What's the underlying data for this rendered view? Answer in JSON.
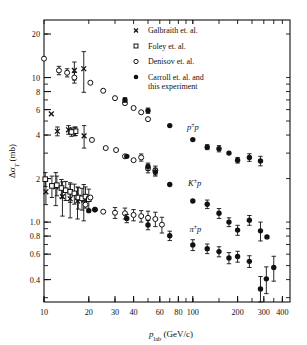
{
  "figure": {
    "title": "",
    "ylabel": "Δσ",
    "ylabel_sub": "T",
    "ylabel_unit": " (mb)",
    "xlabel": "p",
    "xlabel_sub": "lab",
    "xlabel_unit": " (GeV/c)"
  },
  "legend": {
    "items": [
      {
        "label": "Galbraith et. al.",
        "marker": "cross"
      },
      {
        "label": "Foley et. al.",
        "marker": "open-square"
      },
      {
        "label": "Denisov et. al.",
        "marker": "open-circle"
      },
      {
        "label": "Carroll et. al. and",
        "label2": "this experiment",
        "marker": "filled-circle"
      }
    ]
  },
  "annotations": [
    {
      "text": "p",
      "sup": "±",
      "text2": "p",
      "x": 100,
      "y": 4.35
    },
    {
      "text": "K",
      "sup": "±",
      "text2": "p",
      "x": 103,
      "y": 1.78
    },
    {
      "text": "π",
      "sup": "±",
      "text2": "p",
      "x": 104,
      "y": 0.86
    }
  ],
  "chart_data": {
    "type": "scatter",
    "scale": {
      "x": "log",
      "y": "log"
    },
    "xlim": [
      10,
      450
    ],
    "ylim": [
      0.28,
      25
    ],
    "xlabel": "p_lab (GeV/c)",
    "ylabel": "Δσ_T (mb)",
    "xticks": [
      10,
      20,
      30,
      40,
      60,
      80,
      100,
      200,
      300,
      400
    ],
    "xticklabels": [
      "10",
      "20",
      "30",
      "40",
      "60",
      "80",
      "100",
      "200",
      "300",
      "400"
    ],
    "yticks": [
      20,
      10,
      8,
      6,
      4,
      2,
      1.0,
      0.8,
      0.6,
      0.4
    ],
    "yticklabels": [
      "20",
      "10",
      "8",
      "6",
      "4",
      "2",
      "1.0",
      "0.8",
      "0.6",
      "0.4"
    ],
    "grid": false,
    "legend_position": "upper-right",
    "series": [
      {
        "name": "Galbraith et. al.",
        "marker": "cross",
        "points": [
          {
            "x": 16.0,
            "y": 11.2,
            "ey": 1.6
          },
          {
            "x": 18.5,
            "y": 11.5,
            "ey": 3.6
          },
          {
            "x": 12.3,
            "y": 4.25,
            "ey": 0.3
          },
          {
            "x": 14.6,
            "y": 4.35,
            "ey": 0.3
          },
          {
            "x": 16.1,
            "y": 4.25,
            "ey": 0.3
          },
          {
            "x": 18.6,
            "y": 3.95,
            "ey": 0.7
          },
          {
            "x": 10.3,
            "y": 1.62,
            "ey": 0.3
          },
          {
            "x": 12.0,
            "y": 1.75,
            "ey": 0.45
          },
          {
            "x": 13.3,
            "y": 1.5,
            "ey": 0.4
          },
          {
            "x": 15.0,
            "y": 1.45,
            "ey": 0.38
          },
          {
            "x": 16.8,
            "y": 1.4,
            "ey": 0.35
          },
          {
            "x": 18.5,
            "y": 1.42,
            "ey": 0.4
          },
          {
            "x": 11.2,
            "y": 5.6,
            "ey": 0.0
          }
        ]
      },
      {
        "name": "Foley et. al.",
        "marker": "open-square",
        "points": [
          {
            "x": 10.2,
            "y": 1.98,
            "ey": 0.22
          },
          {
            "x": 11.3,
            "y": 1.78,
            "ey": 0.3
          },
          {
            "x": 12.2,
            "y": 1.8,
            "ey": 0.28
          },
          {
            "x": 13.1,
            "y": 1.72,
            "ey": 0.25
          },
          {
            "x": 14.0,
            "y": 1.66,
            "ey": 0.25
          },
          {
            "x": 15.0,
            "y": 1.62,
            "ey": 0.25
          },
          {
            "x": 16.0,
            "y": 1.58,
            "ey": 0.25
          },
          {
            "x": 17.0,
            "y": 1.48,
            "ey": 0.25
          },
          {
            "x": 18.0,
            "y": 1.46,
            "ey": 0.25
          },
          {
            "x": 19.0,
            "y": 1.5,
            "ey": 0.25
          },
          {
            "x": 20.0,
            "y": 1.44,
            "ey": 0.25
          },
          {
            "x": 16.3,
            "y": 4.25,
            "ey": 0.28
          },
          {
            "x": 15.3,
            "y": 4.2,
            "ey": 0.28
          }
        ]
      },
      {
        "name": "Denisov et. al.",
        "marker": "open-circle",
        "points": [
          {
            "x": 10.0,
            "y": 13.5,
            "ey": 0.0
          },
          {
            "x": 12.6,
            "y": 11.2,
            "ey": 0.75
          },
          {
            "x": 14.3,
            "y": 10.8,
            "ey": 0.7
          },
          {
            "x": 16.0,
            "y": 10.0,
            "ey": 0.85
          },
          {
            "x": 20.5,
            "y": 9.2,
            "ey": 0.0
          },
          {
            "x": 25.0,
            "y": 8.1,
            "ey": 0.0
          },
          {
            "x": 30.0,
            "y": 7.2,
            "ey": 0.0
          },
          {
            "x": 35.0,
            "y": 6.65,
            "ey": 0.0
          },
          {
            "x": 40.0,
            "y": 6.15,
            "ey": 0.0
          },
          {
            "x": 45.0,
            "y": 5.75,
            "ey": 0.0
          },
          {
            "x": 50.0,
            "y": 5.15,
            "ey": 0.0
          },
          {
            "x": 21.0,
            "y": 3.7,
            "ey": 0.0
          },
          {
            "x": 26.0,
            "y": 3.25,
            "ey": 0.0
          },
          {
            "x": 30.5,
            "y": 3.15,
            "ey": 0.0
          },
          {
            "x": 35.0,
            "y": 2.85,
            "ey": 0.0
          },
          {
            "x": 40.0,
            "y": 2.68,
            "ey": 0.0
          },
          {
            "x": 45.0,
            "y": 2.8,
            "ey": 0.16
          },
          {
            "x": 50.0,
            "y": 2.35,
            "ey": 0.16
          },
          {
            "x": 56.0,
            "y": 2.28,
            "ey": 0.16
          },
          {
            "x": 22.0,
            "y": 1.22,
            "ey": 0.0
          },
          {
            "x": 25.0,
            "y": 1.18,
            "ey": 0.0
          },
          {
            "x": 30.0,
            "y": 1.16,
            "ey": 0.1
          },
          {
            "x": 35.0,
            "y": 1.15,
            "ey": 0.1
          },
          {
            "x": 40.0,
            "y": 1.12,
            "ey": 0.1
          },
          {
            "x": 45.0,
            "y": 1.1,
            "ey": 0.1
          },
          {
            "x": 50.0,
            "y": 1.07,
            "ey": 0.12
          },
          {
            "x": 56.0,
            "y": 1.05,
            "ey": 0.12
          },
          {
            "x": 62.0,
            "y": 0.96,
            "ey": 0.12
          },
          {
            "x": 19.0,
            "y": 1.32,
            "ey": 0.0
          },
          {
            "x": 20.5,
            "y": 1.48,
            "ey": 0.0
          }
        ]
      },
      {
        "name": "Carroll et. al. and this experiment",
        "marker": "filled-circle",
        "points": [
          {
            "x": 35.0,
            "y": 7.0,
            "ey": 0.25
          },
          {
            "x": 50.0,
            "y": 5.9,
            "ey": 0.25
          },
          {
            "x": 70.0,
            "y": 4.65,
            "ey": 0.0
          },
          {
            "x": 100.0,
            "y": 3.72,
            "ey": 0.0
          },
          {
            "x": 125.0,
            "y": 3.3,
            "ey": 0.13
          },
          {
            "x": 150.0,
            "y": 3.22,
            "ey": 0.16
          },
          {
            "x": 175.0,
            "y": 3.0,
            "ey": 0.0
          },
          {
            "x": 200.0,
            "y": 2.68,
            "ey": 0.12
          },
          {
            "x": 240.0,
            "y": 2.8,
            "ey": 0.17
          },
          {
            "x": 285.0,
            "y": 2.65,
            "ey": 0.2
          },
          {
            "x": 36.0,
            "y": 2.85,
            "ey": 0.0
          },
          {
            "x": 50.0,
            "y": 2.42,
            "ey": 0.14
          },
          {
            "x": 56.0,
            "y": 2.22,
            "ey": 0.14
          },
          {
            "x": 70.0,
            "y": 1.82,
            "ey": 0.0
          },
          {
            "x": 100.0,
            "y": 1.4,
            "ey": 0.0
          },
          {
            "x": 125.0,
            "y": 1.33,
            "ey": 0.09
          },
          {
            "x": 150.0,
            "y": 1.15,
            "ey": 0.09
          },
          {
            "x": 175.0,
            "y": 1.0,
            "ey": 0.07
          },
          {
            "x": 200.0,
            "y": 0.88,
            "ey": 0.07
          },
          {
            "x": 240.0,
            "y": 1.03,
            "ey": 0.08
          },
          {
            "x": 285.0,
            "y": 0.87,
            "ey": 0.13
          },
          {
            "x": 315.0,
            "y": 0.79,
            "ey": 0.0
          },
          {
            "x": 36.0,
            "y": 1.06,
            "ey": 0.07
          },
          {
            "x": 50.0,
            "y": 0.955,
            "ey": 0.07
          },
          {
            "x": 70.0,
            "y": 0.805,
            "ey": 0.06
          },
          {
            "x": 100.0,
            "y": 0.695,
            "ey": 0.06
          },
          {
            "x": 125.0,
            "y": 0.655,
            "ey": 0.05
          },
          {
            "x": 150.0,
            "y": 0.625,
            "ey": 0.05
          },
          {
            "x": 175.0,
            "y": 0.565,
            "ey": 0.05
          },
          {
            "x": 200.0,
            "y": 0.578,
            "ey": 0.05
          },
          {
            "x": 240.0,
            "y": 0.535,
            "ey": 0.05
          },
          {
            "x": 285.0,
            "y": 0.345,
            "ey": 0.075
          },
          {
            "x": 312.0,
            "y": 0.405,
            "ey": 0.085
          },
          {
            "x": 350.0,
            "y": 0.485,
            "ey": 0.095
          },
          {
            "x": 22.0,
            "y": 1.22,
            "ey": 0.0
          },
          {
            "x": 20.0,
            "y": 1.2,
            "ey": 0.0
          }
        ]
      }
    ]
  }
}
